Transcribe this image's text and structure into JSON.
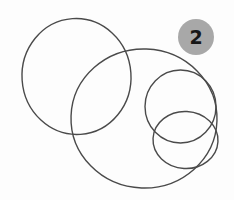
{
  "canvas": {
    "width": 234,
    "height": 200,
    "background_color": "#fdfdfd"
  },
  "figure": {
    "stroke_color": "#4a4a4a",
    "stroke_width": 1.4,
    "fill": "none",
    "shape_count": 4,
    "shapes": [
      {
        "name": "circle-large-left",
        "cx": 76.5,
        "cy": 76.5,
        "rx": 54.5,
        "ry": 58.0,
        "rotate": -4
      },
      {
        "name": "circle-large-center",
        "cx": 144.0,
        "cy": 118.5,
        "rx": 73.0,
        "ry": 69.5,
        "rotate": 2
      },
      {
        "name": "circle-medium-right",
        "cx": 180.5,
        "cy": 106.5,
        "rx": 35.5,
        "ry": 36.5,
        "rotate": 0
      },
      {
        "name": "circle-small-bottom-right",
        "cx": 185.5,
        "cy": 140.0,
        "rx": 32.5,
        "ry": 28.5,
        "rotate": 3
      }
    ]
  },
  "badge": {
    "label": "2",
    "background_color": "#a8a8a8",
    "text_color": "#161616",
    "center_x": 196,
    "center_y": 37,
    "radius": 18,
    "font_size": 19
  }
}
